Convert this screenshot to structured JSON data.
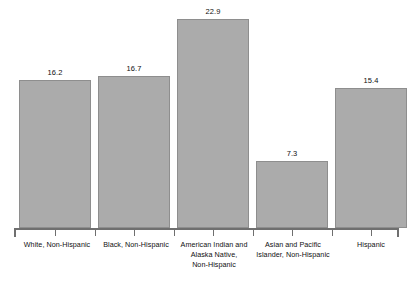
{
  "chart_data": {
    "type": "bar",
    "title": "",
    "subtitle": "",
    "xlabel": "",
    "ylabel": "",
    "ylim": [
      0,
      25
    ],
    "grid": false,
    "legend": false,
    "legend_position": "none",
    "axis": {
      "x_axis_visible": true,
      "y_axis_visible": false,
      "tick_direction": "down",
      "tick_positions": [
        "boundaries",
        "centers"
      ]
    },
    "data_labels_shown": true,
    "categories": [
      "White, Non-Hispanic",
      "Black, Non-Hispanic",
      "American Indian and Alaska Native, Non-Hispanic",
      "Asian and Pacific Islander, Non-Hispanic",
      "Hispanic"
    ],
    "category_label_lines": [
      [
        "White, Non-Hispanic"
      ],
      [
        "Black, Non-Hispanic"
      ],
      [
        "American Indian and",
        "Alaska Native,",
        "Non-Hispanic"
      ],
      [
        "Asian and Pacific",
        "Islander, Non-Hispanic"
      ],
      [
        "Hispanic"
      ]
    ],
    "values": [
      16.2,
      16.7,
      22.9,
      7.3,
      15.4
    ],
    "value_labels": [
      "16.2",
      "16.7",
      "22.9",
      "7.3",
      "15.4"
    ],
    "colors": {
      "bar_fill": "#ababab",
      "bar_border": "#8e8e8e",
      "axis": "#6f6f6f",
      "text": "#101010",
      "background": "#ffffff"
    }
  }
}
